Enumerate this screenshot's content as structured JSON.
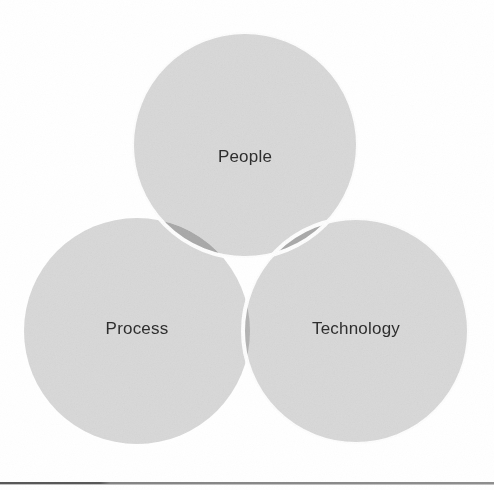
{
  "diagram": {
    "type": "venn",
    "title": "",
    "canvas": {
      "width": 494,
      "height": 490,
      "background": "#ffffff"
    },
    "sets": [
      {
        "id": "people",
        "label": "People",
        "cx": 245,
        "cy": 145,
        "r": 113,
        "fill": "#d9d9d9",
        "stroke": "#ffffff",
        "stroke_width": 4,
        "label_x": 245,
        "label_y": 158
      },
      {
        "id": "process",
        "label": "Process",
        "cx": 137,
        "cy": 331,
        "r": 113,
        "fill": "#d9d9d9",
        "stroke": "#ffffff",
        "stroke_width": 4,
        "label_x": 137,
        "label_y": 330
      },
      {
        "id": "technology",
        "label": "Technology",
        "cx": 356,
        "cy": 331,
        "r": 113,
        "fill": "#d9d9d9",
        "stroke": "#ffffff",
        "stroke_width": 4,
        "label_x": 356,
        "label_y": 330
      }
    ],
    "intersections": [
      {
        "id": "people-process",
        "sets": [
          "people",
          "process"
        ],
        "fill": "#a9a9a9"
      },
      {
        "id": "people-technology",
        "sets": [
          "people",
          "technology"
        ],
        "fill": "#a9a9a9"
      },
      {
        "id": "process-technology",
        "sets": [
          "process",
          "technology"
        ],
        "fill": "#b4b4b4"
      },
      {
        "id": "all-three",
        "sets": [
          "people",
          "process",
          "technology"
        ],
        "fill": "#b0b0b0"
      }
    ],
    "label_color": "#2e2e2e",
    "label_font_size": 17
  },
  "footer": {
    "rule_color": "#3b3b3b",
    "rule_y": 482
  }
}
